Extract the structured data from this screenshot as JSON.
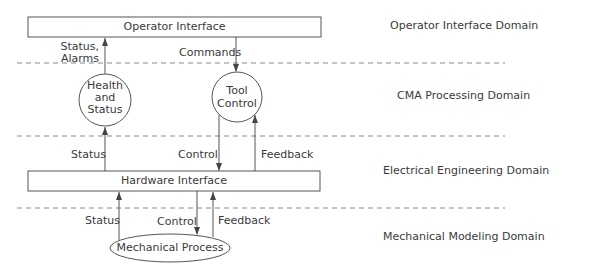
{
  "boxes": {
    "operator_interface": "Operator Interface",
    "hardware_interface": "Hardware Interface"
  },
  "processes": {
    "health_status": [
      "Health",
      "and",
      "Status"
    ],
    "tool_control": [
      "Tool",
      "Control"
    ],
    "mechanical_process": "Mechanical Process"
  },
  "flows": {
    "status_alarms": [
      "Status,",
      "Alarms"
    ],
    "commands": "Commands",
    "status_ee": "Status",
    "control_ee": "Control",
    "feedback_ee": "Feedback",
    "status_mech": "Status",
    "control_mech": "Control",
    "feedback_mech": "Feedback"
  },
  "domains": {
    "operator": "Operator Interface Domain",
    "cma": "CMA Processing Domain",
    "electrical": "Electrical Engineering Domain",
    "mechanical": "Mechanical Modeling Domain"
  },
  "colors": {
    "line": "#555555",
    "dash": "#888888",
    "text": "#3a3a3a"
  }
}
